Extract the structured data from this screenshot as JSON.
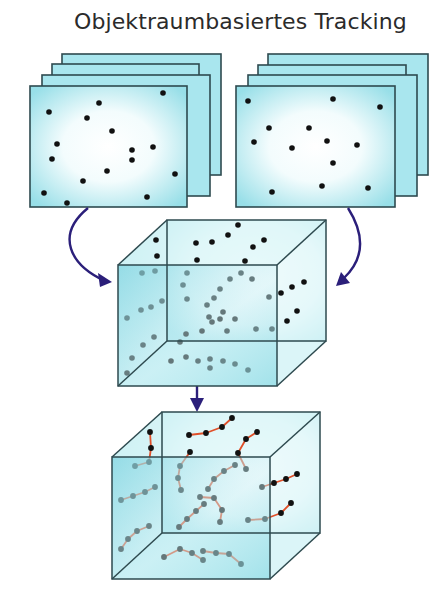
{
  "title": "Objektraumbasiertes Tracking",
  "colors": {
    "frame_fill_edge": "#a8e4ec",
    "frame_fill_center": "#ffffff",
    "frame_stroke": "#2e4a4f",
    "cube_fill": "#9fe0e8",
    "cube_stroke": "#2e4a4f",
    "dot": "#111111",
    "track": "#e0502a",
    "arrow": "#2b1f7a"
  },
  "stacks": [
    {
      "name": "left-image-stack",
      "frames": [
        {
          "x": 62,
          "y": 54,
          "w": 159,
          "h": 121
        },
        {
          "x": 52,
          "y": 64,
          "w": 147,
          "h": 122
        },
        {
          "x": 42,
          "y": 75,
          "w": 168,
          "h": 121
        },
        {
          "x": 30,
          "y": 86,
          "w": 157,
          "h": 121
        }
      ],
      "dots": [
        [
          49,
          112
        ],
        [
          99,
          103
        ],
        [
          87,
          118
        ],
        [
          163,
          93
        ],
        [
          57,
          144
        ],
        [
          52,
          159
        ],
        [
          112,
          131
        ],
        [
          132,
          150
        ],
        [
          132,
          160
        ],
        [
          153,
          147
        ],
        [
          107,
          171
        ],
        [
          83,
          181
        ],
        [
          175,
          174
        ],
        [
          44,
          193
        ],
        [
          67,
          203
        ],
        [
          147,
          197
        ]
      ]
    },
    {
      "name": "right-image-stack",
      "frames": [
        {
          "x": 268,
          "y": 54,
          "w": 160,
          "h": 121
        },
        {
          "x": 258,
          "y": 65,
          "w": 148,
          "h": 121
        },
        {
          "x": 248,
          "y": 75,
          "w": 169,
          "h": 121
        },
        {
          "x": 236,
          "y": 86,
          "w": 159,
          "h": 121
        }
      ],
      "dots": [
        [
          248,
          101
        ],
        [
          333,
          99
        ],
        [
          380,
          107
        ],
        [
          269,
          128
        ],
        [
          309,
          128
        ],
        [
          327,
          141
        ],
        [
          254,
          142
        ],
        [
          292,
          148
        ],
        [
          357,
          145
        ],
        [
          333,
          163
        ],
        [
          272,
          192
        ],
        [
          322,
          186
        ],
        [
          368,
          188
        ]
      ]
    }
  ],
  "cubes": [
    {
      "name": "merged-object-space-cube",
      "back": {
        "x1": 167,
        "y1": 220,
        "x2": 326,
        "y2": 341
      },
      "front": {
        "x1": 118,
        "y1": 265,
        "x2": 277,
        "y2": 386
      },
      "dots": [
        [
          156,
          240
        ],
        [
          157,
          256
        ],
        [
          142,
          273
        ],
        [
          155,
          271
        ],
        [
          196,
          243
        ],
        [
          212,
          242
        ],
        [
          228,
          235
        ],
        [
          238,
          225
        ],
        [
          253,
          247
        ],
        [
          264,
          240
        ],
        [
          197,
          260
        ],
        [
          245,
          261
        ],
        [
          187,
          273
        ],
        [
          241,
          273
        ],
        [
          252,
          279
        ],
        [
          230,
          279
        ],
        [
          183,
          285
        ],
        [
          220,
          289
        ],
        [
          187,
          299
        ],
        [
          214,
          298
        ],
        [
          162,
          301
        ],
        [
          141,
          310
        ],
        [
          151,
          307
        ],
        [
          127,
          318
        ],
        [
          207,
          305
        ],
        [
          223,
          312
        ],
        [
          209,
          317
        ],
        [
          212,
          322
        ],
        [
          235,
          319
        ],
        [
          202,
          331
        ],
        [
          220,
          319
        ],
        [
          186,
          334
        ],
        [
          227,
          331
        ],
        [
          180,
          342
        ],
        [
          154,
          337
        ],
        [
          143,
          345
        ],
        [
          132,
          358
        ],
        [
          127,
          373
        ],
        [
          269,
          297
        ],
        [
          281,
          293
        ],
        [
          292,
          287
        ],
        [
          304,
          282
        ],
        [
          297,
          311
        ],
        [
          287,
          321
        ],
        [
          256,
          329
        ],
        [
          272,
          329
        ],
        [
          171,
          361
        ],
        [
          186,
          357
        ],
        [
          198,
          361
        ],
        [
          210,
          359
        ],
        [
          210,
          368
        ],
        [
          223,
          361
        ],
        [
          235,
          364
        ],
        [
          248,
          370
        ]
      ]
    },
    {
      "name": "tracked-trajectories-cube",
      "back": {
        "x1": 162,
        "y1": 412,
        "x2": 320,
        "y2": 533
      },
      "front": {
        "x1": 112,
        "y1": 457,
        "x2": 270,
        "y2": 579
      },
      "tracks": [
        [
          [
            189,
            435
          ],
          [
            206,
            433
          ],
          [
            222,
            427
          ],
          [
            232,
            418
          ]
        ],
        [
          [
            150,
            432
          ],
          [
            151,
            448
          ],
          [
            149,
            462
          ],
          [
            135,
            466
          ]
        ],
        [
          [
            257,
            432
          ],
          [
            246,
            439
          ],
          [
            238,
            453
          ],
          [
            246,
            469
          ]
        ],
        [
          [
            190,
            452
          ],
          [
            180,
            466
          ],
          [
            178,
            478
          ],
          [
            181,
            490
          ]
        ],
        [
          [
            208,
            489
          ],
          [
            214,
            479
          ],
          [
            224,
            471
          ],
          [
            235,
            465
          ]
        ],
        [
          [
            121,
            500
          ],
          [
            133,
            496
          ],
          [
            145,
            492
          ],
          [
            155,
            487
          ]
        ],
        [
          [
            262,
            487
          ],
          [
            274,
            483
          ],
          [
            286,
            479
          ],
          [
            297,
            474
          ]
        ],
        [
          [
            200,
            497
          ],
          [
            214,
            498
          ],
          [
            222,
            510
          ],
          [
            220,
            522
          ]
        ],
        [
          [
            179,
            527
          ],
          [
            187,
            519
          ],
          [
            196,
            511
          ],
          [
            204,
            504
          ]
        ],
        [
          [
            248,
            520
          ],
          [
            265,
            519
          ],
          [
            281,
            513
          ],
          [
            291,
            503
          ]
        ],
        [
          [
            121,
            549
          ],
          [
            128,
            539
          ],
          [
            137,
            531
          ],
          [
            149,
            526
          ]
        ],
        [
          [
            164,
            557
          ],
          [
            180,
            549
          ],
          [
            192,
            553
          ],
          [
            203,
            560
          ]
        ],
        [
          [
            203,
            551
          ],
          [
            216,
            553
          ],
          [
            229,
            554
          ],
          [
            241,
            564
          ]
        ]
      ]
    }
  ],
  "arrows": [
    {
      "name": "left-to-cube-arrow",
      "path": "M88 208 C 55 235, 70 265, 105 281",
      "head": [
        [
          112,
          282
        ],
        [
          98,
          273
        ],
        [
          100,
          287
        ]
      ]
    },
    {
      "name": "right-to-cube-arrow",
      "path": "M348 208 C 365 235, 365 258, 344 278",
      "head": [
        [
          336,
          286
        ],
        [
          341,
          272
        ],
        [
          350,
          283
        ]
      ]
    },
    {
      "name": "cube-to-tracks-arrow",
      "path": "M197 386 L 197 400",
      "head": [
        [
          197,
          412
        ],
        [
          190,
          398
        ],
        [
          204,
          398
        ]
      ]
    }
  ]
}
